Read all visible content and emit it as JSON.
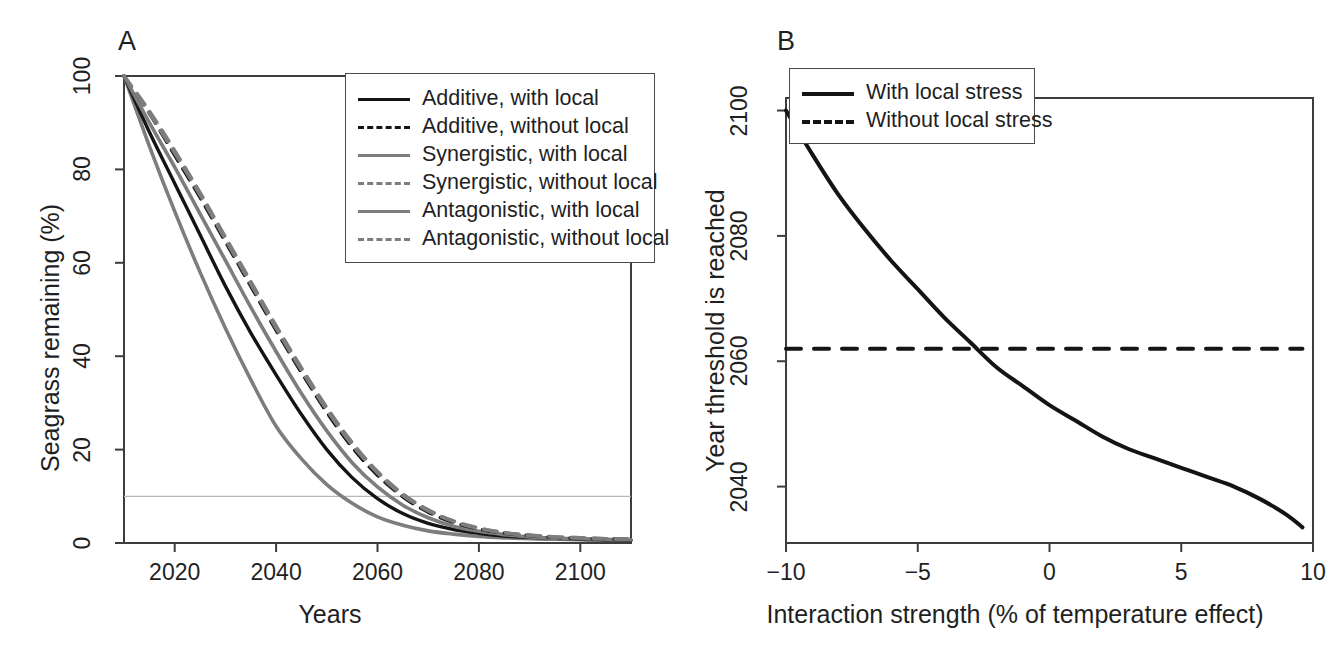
{
  "figure": {
    "background": "#ffffff",
    "panels": [
      "A",
      "B"
    ]
  },
  "panel_a": {
    "label": "A",
    "legend": [
      {
        "label": "Additive, with local",
        "color": "#141414",
        "dash": "solid"
      },
      {
        "label": "Additive, without local",
        "color": "#141414",
        "dash": "dashed"
      },
      {
        "label": "Synergistic, with local",
        "color": "#7d7d7d",
        "dash": "solid"
      },
      {
        "label": "Synergistic, without local",
        "color": "#7d7d7d",
        "dash": "dashed"
      },
      {
        "label": "Antagonistic, with local",
        "color": "#7d7d7d",
        "dash": "solid"
      },
      {
        "label": "Antagonistic, without local",
        "color": "#7d7d7d",
        "dash": "dashed"
      }
    ]
  },
  "panel_b": {
    "label": "B",
    "legend": [
      {
        "label": "With local stress",
        "color": "#141414",
        "dash": "solid"
      },
      {
        "label": "Without local stress",
        "color": "#141414",
        "dash": "dashed"
      }
    ]
  },
  "chart_data": [
    {
      "type": "line",
      "panel": "A",
      "title": "",
      "xlabel": "Years",
      "ylabel": "Seagrass remaining (%)",
      "xlim": [
        2010,
        2110
      ],
      "ylim": [
        0,
        100
      ],
      "xticks": [
        2020,
        2040,
        2060,
        2080,
        2100
      ],
      "yticks": [
        0,
        20,
        40,
        60,
        80,
        100
      ],
      "grid": false,
      "legend_position": "top-right",
      "threshold_line": {
        "y": 10,
        "color": "#b8b8b8",
        "dash": "solid",
        "label": ""
      },
      "x": [
        2010,
        2015,
        2020,
        2025,
        2030,
        2035,
        2040,
        2045,
        2050,
        2055,
        2060,
        2065,
        2070,
        2075,
        2080,
        2085,
        2090,
        2095,
        2100,
        2105,
        2110
      ],
      "series": [
        {
          "name": "Antagonistic, with local",
          "color": "#7d7d7d",
          "dash": "solid",
          "values": [
            100,
            85,
            71,
            58,
            46,
            35,
            25,
            18,
            12.5,
            8.5,
            5.6,
            3.8,
            2.6,
            1.9,
            1.4,
            1.1,
            0.9,
            0.8,
            0.7,
            0.6,
            0.6
          ],
          "threshold_year": 2038
        },
        {
          "name": "Additive, with local",
          "color": "#141414",
          "dash": "solid",
          "values": [
            100,
            88,
            77,
            66,
            55,
            45,
            36,
            27.5,
            20,
            14,
            9.5,
            6.3,
            4.2,
            2.9,
            2.1,
            1.5,
            1.2,
            1.0,
            0.8,
            0.7,
            0.6
          ],
          "threshold_year": 2049
        },
        {
          "name": "Synergistic, with local",
          "color": "#7d7d7d",
          "dash": "solid",
          "values": [
            100,
            90,
            80.5,
            70.5,
            60.5,
            50.5,
            41,
            32,
            24,
            17.2,
            12,
            8.1,
            5.4,
            3.6,
            2.5,
            1.8,
            1.3,
            1.0,
            0.9,
            0.8,
            0.7
          ],
          "threshold_year": 2054
        },
        {
          "name": "Additive, without local",
          "color": "#141414",
          "dash": "dashed",
          "values": [
            100,
            92,
            83,
            74,
            64.5,
            55,
            45.5,
            36.5,
            28,
            20.5,
            14.5,
            9.9,
            6.6,
            4.4,
            3.0,
            2.1,
            1.6,
            1.2,
            1.0,
            0.9,
            0.8
          ],
          "threshold_year": 2057
        },
        {
          "name": "Synergistic, without local",
          "color": "#7d7d7d",
          "dash": "dashed",
          "values": [
            100,
            92.5,
            84,
            75,
            65.5,
            56,
            46.5,
            37.5,
            29,
            21.5,
            15.3,
            10.5,
            7.1,
            4.7,
            3.2,
            2.2,
            1.7,
            1.3,
            1.1,
            0.9,
            0.8
          ],
          "threshold_year": 2058
        },
        {
          "name": "Antagonistic, without local",
          "color": "#7d7d7d",
          "dash": "dashed",
          "values": [
            100,
            92,
            83.5,
            74.5,
            65,
            55.5,
            46,
            37,
            28.5,
            21,
            15,
            10.2,
            6.9,
            4.6,
            3.1,
            2.2,
            1.6,
            1.3,
            1.1,
            0.9,
            0.8
          ],
          "threshold_year": 2057
        }
      ]
    },
    {
      "type": "line",
      "panel": "B",
      "title": "",
      "xlabel": "Interaction strength (% of temperature effect)",
      "ylabel": "Year threshold is reached",
      "xlim": [
        -10,
        10
      ],
      "ylim": [
        2031,
        2102
      ],
      "xticks": [
        -10,
        -5,
        0,
        5,
        10
      ],
      "yticks": [
        2040,
        2060,
        2080,
        2100
      ],
      "grid": false,
      "legend_position": "top-left",
      "x": [
        -10,
        -9,
        -8,
        -7,
        -6,
        -5,
        -4,
        -3,
        -2,
        -1,
        0,
        1,
        2,
        3,
        4,
        5,
        6,
        7,
        8,
        9,
        9.6
      ],
      "series": [
        {
          "name": "With local stress",
          "color": "#141414",
          "dash": "solid",
          "values": [
            2100,
            2093,
            2086.5,
            2081,
            2076,
            2071.5,
            2067,
            2063,
            2059,
            2056,
            2053,
            2050.5,
            2048,
            2046,
            2044.5,
            2043,
            2041.5,
            2040,
            2038,
            2035.5,
            2033.5
          ]
        },
        {
          "name": "Without local stress",
          "color": "#141414",
          "dash": "dashed",
          "values": [
            2062,
            2062,
            2062,
            2062,
            2062,
            2062,
            2062,
            2062,
            2062,
            2062,
            2062,
            2062,
            2062,
            2062,
            2062,
            2062,
            2062,
            2062,
            2062,
            2062,
            2062
          ]
        }
      ],
      "crossing_point": {
        "x": -3.7,
        "y": 2062
      }
    }
  ]
}
